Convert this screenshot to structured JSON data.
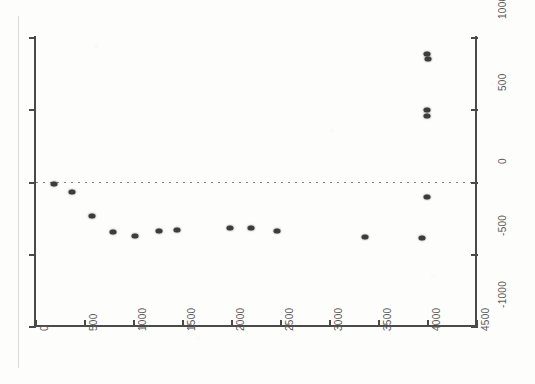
{
  "chart_data": {
    "type": "scatter",
    "title": "",
    "subtitle": "",
    "xlabel": "",
    "ylabel": "",
    "xlim": [
      0,
      4500
    ],
    "ylim": [
      -1000,
      1000
    ],
    "x_ticks": [
      0,
      500,
      1000,
      1500,
      2000,
      2500,
      3000,
      3500,
      4000,
      4500
    ],
    "x_tick_labels": [
      "0",
      "500",
      "1000",
      "1500",
      "2000",
      "2500",
      "3000",
      "3500",
      "4000",
      "4500"
    ],
    "y_ticks": [
      1000,
      500,
      0,
      -500,
      -1000
    ],
    "y_tick_labels": [
      "1000",
      "500",
      "0",
      "-500",
      "-1000"
    ],
    "y_axis_side": "right",
    "x_tick_label_rotation": -90,
    "y_tick_label_rotation": -90,
    "grid": false,
    "legend": null,
    "reference_lines": [
      {
        "orientation": "horizontal",
        "value": 0,
        "style": "dotted",
        "color": "#5a5a5a"
      }
    ],
    "marker": {
      "shape": "circle",
      "color": "#3c3c3c",
      "size": 6
    },
    "points": [
      {
        "x": 190,
        "y": -15
      },
      {
        "x": 375,
        "y": -70
      },
      {
        "x": 580,
        "y": -238
      },
      {
        "x": 800,
        "y": -350
      },
      {
        "x": 1020,
        "y": -378
      },
      {
        "x": 1270,
        "y": -343
      },
      {
        "x": 1450,
        "y": -336
      },
      {
        "x": 1990,
        "y": -322
      },
      {
        "x": 2200,
        "y": -322
      },
      {
        "x": 2470,
        "y": -343
      },
      {
        "x": 3370,
        "y": -385
      },
      {
        "x": 4000,
        "y": 885
      },
      {
        "x": 4010,
        "y": 850
      },
      {
        "x": 4000,
        "y": 495
      },
      {
        "x": 4000,
        "y": 455
      },
      {
        "x": 4000,
        "y": -105
      },
      {
        "x": 3950,
        "y": -392
      }
    ]
  },
  "axes": {
    "frame_color": "#4a4a4a",
    "label_color": "#5b5b5b",
    "background": "#fdfdfc"
  }
}
